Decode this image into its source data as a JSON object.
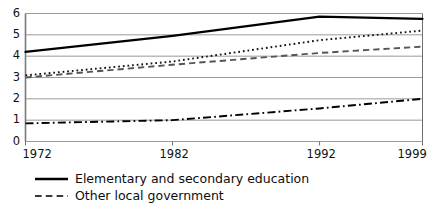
{
  "chart_data": {
    "type": "line",
    "title": "",
    "subtitle": "",
    "xlabel": "",
    "ylabel": "",
    "xlim": [
      1972,
      1999
    ],
    "ylim": [
      0,
      6
    ],
    "yticks": [
      0,
      1,
      2,
      3,
      4,
      5,
      6
    ],
    "ytick_labels": [
      "0",
      "1",
      "2",
      "3",
      "4",
      "5",
      "6"
    ],
    "xticks": [
      1972,
      1982,
      1992,
      1999
    ],
    "xtick_labels": [
      "1972",
      "1982",
      "1992",
      "1999"
    ],
    "grid": "horizontal",
    "legend_position": "below",
    "series": [
      {
        "name": "Elementary and secondary education",
        "style": "solid",
        "color": "#000000",
        "width": 2.3,
        "x": [
          1972,
          1982,
          1992,
          1999
        ],
        "values": [
          4.2,
          4.95,
          5.85,
          5.75
        ]
      },
      {
        "name": "",
        "style": "dotted",
        "color": "#111111",
        "width": 1.9,
        "x": [
          1972,
          1982,
          1992,
          1999
        ],
        "values": [
          3.1,
          3.75,
          4.75,
          5.2
        ]
      },
      {
        "name": "Other local government",
        "style": "dashed",
        "color": "#555555",
        "width": 1.9,
        "x": [
          1972,
          1982,
          1992,
          1999
        ],
        "values": [
          3.0,
          3.6,
          4.15,
          4.45
        ]
      },
      {
        "name": "",
        "style": "dashdot",
        "color": "#000000",
        "width": 1.9,
        "x": [
          1972,
          1982,
          1992,
          1999
        ],
        "values": [
          0.85,
          1.0,
          1.55,
          2.0
        ]
      }
    ],
    "legend": [
      {
        "label": "Elementary and secondary education",
        "style": "solid"
      },
      {
        "label": "Other local government",
        "style": "dashed"
      }
    ],
    "axis_color": "#8c8c8c",
    "grid_color": "#9a9a9a",
    "frame_color": "#6e6e6e"
  }
}
